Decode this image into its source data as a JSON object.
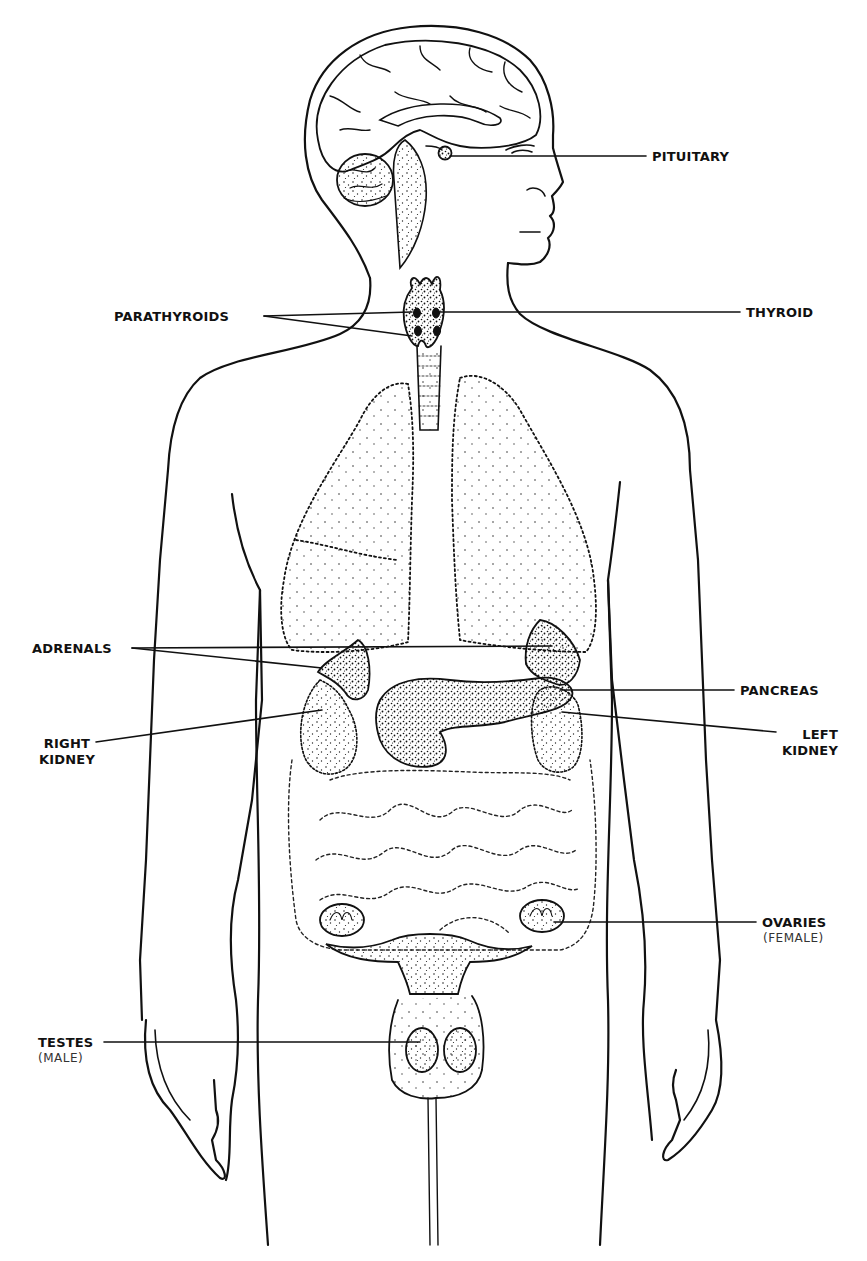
{
  "diagram": {
    "colors": {
      "ink": "#111111",
      "background": "#ffffff",
      "caption": "#333333"
    },
    "labels": {
      "pituitary": {
        "text": "PITUITARY"
      },
      "thyroid": {
        "text": "THYROID"
      },
      "parathyroids": {
        "text": "PARATHYROIDS"
      },
      "adrenals": {
        "text": "ADRENALS"
      },
      "pancreas": {
        "text": "PANCREAS"
      },
      "right_kidney": {
        "line1": "RIGHT",
        "line2": "KIDNEY"
      },
      "left_kidney": {
        "line1": "LEFT",
        "line2": "KIDNEY"
      },
      "ovaries": {
        "text": "OVARIES",
        "note": "(FEMALE)"
      },
      "testes": {
        "text": "TESTES",
        "note": "(MALE)"
      }
    }
  }
}
